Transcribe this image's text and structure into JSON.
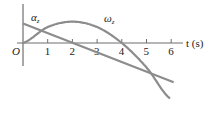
{
  "chart_data": {
    "type": "line",
    "title": "",
    "xlabel": "t (s)",
    "ylabel": "",
    "origin_label": "O",
    "xlim": [
      0,
      6.5
    ],
    "x_ticks": [
      "1",
      "2",
      "3",
      "4",
      "5",
      "6"
    ],
    "grid": false,
    "legend": "inline",
    "series": [
      {
        "name": "α_z",
        "label": "α",
        "subscript": "z",
        "shape": "linear",
        "x": [
          0,
          6.1
        ],
        "values": [
          0.8,
          -1.6
        ]
      },
      {
        "name": "ω_z",
        "label": "ω",
        "subscript": "z",
        "shape": "parabola",
        "x": [
          0,
          1,
          2,
          3,
          4,
          5,
          6
        ],
        "values": [
          0,
          0.65,
          0.87,
          0.65,
          0,
          -1.0,
          -2.3
        ]
      }
    ],
    "colors": {
      "curves": "#8c8c8c",
      "axes": "#6e6e6e"
    }
  }
}
